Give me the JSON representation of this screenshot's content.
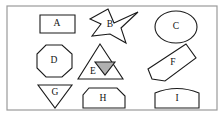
{
  "figure": {
    "background_color": "#ffffff",
    "frame_color": "#9a9a9a",
    "outline_color": "#1a1a1a",
    "fill_color": "#ffffff",
    "shaded_fill_color": "#b0b0b0"
  },
  "shapes": [
    {
      "id": "A",
      "label": "A",
      "kind": "rectangle",
      "row": 1,
      "column": 1,
      "label_x": 57,
      "label_y": 24,
      "filled": false,
      "points": "40,15 75,15 75,33 40,33"
    },
    {
      "id": "B",
      "label": "B",
      "kind": "four-pointed-star",
      "row": 1,
      "column": 2,
      "label_x": 110,
      "label_y": 25,
      "filled": false,
      "points": "108,9 114,23 138,12 121,28 126,43 110,34 92,36 101,24 90,19"
    },
    {
      "id": "C",
      "label": "C",
      "kind": "ellipse",
      "row": 1,
      "column": 3,
      "label_x": 176,
      "label_y": 27,
      "filled": false,
      "cx": 176,
      "cy": 27,
      "rx": 21,
      "ry": 16
    },
    {
      "id": "D",
      "label": "D",
      "kind": "octagon",
      "row": 2,
      "column": 1,
      "label_x": 54,
      "label_y": 61,
      "filled": false,
      "points": "46,45 62,45 72,54 72,68 62,77 46,77 37,68 37,54"
    },
    {
      "id": "E",
      "label": "E",
      "kind": "triangle",
      "row": 2,
      "column": 2,
      "label_x": 93,
      "label_y": 72,
      "filled": false,
      "points": "100,44 123,79 78,79"
    },
    {
      "id": "E-inner",
      "label": "",
      "kind": "inverted-triangle-shaded",
      "row": 2,
      "column": 2,
      "filled": true,
      "points": "95,62 115,62 105,75"
    },
    {
      "id": "F",
      "label": "F",
      "kind": "rotated-pencil",
      "row": 2,
      "column": 3,
      "label_x": 173,
      "label_y": 63,
      "filled": false,
      "points": "186,44 196,58 165,81 152,79 148,69"
    },
    {
      "id": "G",
      "label": "G",
      "kind": "inverted-triangle",
      "row": 3,
      "column": 1,
      "label_x": 55,
      "label_y": 93,
      "filled": false,
      "points": "38,85 72,85 55,108"
    },
    {
      "id": "H",
      "label": "H",
      "kind": "pentagon",
      "row": 3,
      "column": 2,
      "label_x": 103,
      "label_y": 99,
      "filled": false,
      "points": "89,88 117,88 125,96 125,108 83,108 83,95"
    },
    {
      "id": "I",
      "label": "I",
      "kind": "domed-rectangle",
      "row": 3,
      "column": 3,
      "label_x": 177,
      "label_y": 99,
      "filled": false,
      "path": "M 155 108 L 155 93 Q 177 84 199 93 L 199 108 Z"
    }
  ]
}
